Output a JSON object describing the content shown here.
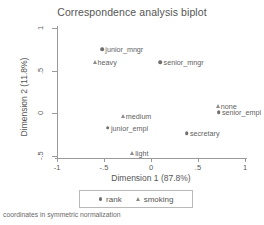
{
  "chart_data": {
    "type": "scatter",
    "title": "Correspondence analysis biplot",
    "xlabel": "Dimension 1 (87.8%)",
    "ylabel": "Dimension 2 (11.8%)",
    "xlim": [
      -1,
      1
    ],
    "ylim": [
      -0.5,
      1
    ],
    "xticks": [
      "-1",
      "-.5",
      "0",
      ".5",
      "1"
    ],
    "xtick_values": [
      -1,
      -0.5,
      0,
      0.5,
      1
    ],
    "yticks": [
      "1",
      ".5",
      "0",
      "-.5"
    ],
    "ytick_values": [
      1,
      0.5,
      0,
      -0.5
    ],
    "grid": false,
    "legend_position": "bottom-center",
    "footnote": "coordinates in symmetric normalization",
    "series": [
      {
        "name": "rank",
        "marker": "circle",
        "color": "#6f6f6f",
        "points": [
          {
            "label": "junior_mngr",
            "x": -0.52,
            "y": 0.75
          },
          {
            "label": "senior_mngr",
            "x": 0.1,
            "y": 0.6
          },
          {
            "label": "senior_empl",
            "x": 0.72,
            "y": 0.01
          },
          {
            "label": "junior_empl",
            "x": -0.46,
            "y": -0.17
          },
          {
            "label": "secretary",
            "x": 0.38,
            "y": -0.23
          }
        ]
      },
      {
        "name": "smoking",
        "marker": "triangle",
        "color": "#8c8c8c",
        "points": [
          {
            "label": "heavy",
            "x": -0.6,
            "y": 0.6
          },
          {
            "label": "none",
            "x": 0.71,
            "y": 0.09
          },
          {
            "label": "medium",
            "x": -0.3,
            "y": -0.03
          },
          {
            "label": "light",
            "x": -0.2,
            "y": -0.46
          }
        ]
      }
    ]
  },
  "legend": {
    "entries": [
      {
        "label": "rank",
        "marker": "circle"
      },
      {
        "label": "smoking",
        "marker": "triangle"
      }
    ]
  }
}
